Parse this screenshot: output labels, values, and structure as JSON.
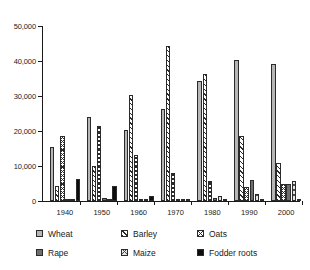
{
  "chart_data": {
    "type": "bar",
    "title": "",
    "subtitle": "",
    "xlabel": "",
    "ylabel": "",
    "categories": [
      "1940",
      "1950",
      "1960",
      "1970",
      "1980",
      "1990",
      "2000"
    ],
    "ylim": [
      0,
      50000
    ],
    "yticks": [
      0,
      10000,
      20000,
      30000,
      40000,
      50000
    ],
    "ytick_labels": [
      "0",
      "10,000",
      "20,000",
      "30,000",
      "40,000",
      "50,000"
    ],
    "grid": false,
    "legend_position": "bottom",
    "series": [
      {
        "name": "Wheat",
        "pattern": "solid-light-gray",
        "color": "#b6b6b6",
        "values": [
          15300,
          24000,
          20300,
          26200,
          34200,
          40300,
          39200
        ]
      },
      {
        "name": "Barley",
        "pattern": "diagonal-hatch",
        "color": "#ffffff",
        "values": [
          4300,
          10000,
          30200,
          44200,
          36200,
          18700,
          10900
        ]
      },
      {
        "name": "Oats",
        "pattern": "cross-hatch",
        "color": "#ffffff",
        "values": [
          18700,
          21500,
          13200,
          8100,
          5700,
          4000,
          4900
        ]
      },
      {
        "name": "Rape",
        "pattern": "solid-dark-gray",
        "color": "#6e6e6e",
        "values": [
          700,
          950,
          650,
          700,
          800,
          5900,
          5000
        ]
      },
      {
        "name": "Maize",
        "pattern": "light-cross-hatch",
        "color": "#e4e4e4",
        "values": [
          120,
          180,
          300,
          350,
          1400,
          2100,
          5700
        ]
      },
      {
        "name": "Fodder roots",
        "pattern": "solid-black",
        "color": "#0d0d0d",
        "values": [
          6200,
          4200,
          1300,
          300,
          200,
          150,
          350
        ]
      }
    ]
  },
  "legend": {
    "rows": [
      [
        {
          "label": "Wheat",
          "swatch": "wheat-swatch"
        },
        {
          "label": "Barley",
          "swatch": "barley-swatch"
        },
        {
          "label": "Oats",
          "swatch": "oats-swatch"
        }
      ],
      [
        {
          "label": "Rape",
          "swatch": "rape-swatch"
        },
        {
          "label": "Maize",
          "swatch": "maize-swatch"
        },
        {
          "label": "Fodder roots",
          "swatch": "fodder-roots-swatch"
        }
      ]
    ]
  }
}
